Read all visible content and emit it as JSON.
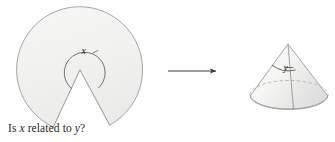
{
  "figure": {
    "caption": {
      "prefix": "Is ",
      "var_x": "x",
      "middle": " related to ",
      "var_y": "y",
      "suffix": "?"
    },
    "left_shape": {
      "name": "circular-sector-with-wedge-removed",
      "angle_label": "x",
      "description": "flat disk sector with a wedge cut out, reflex angle x marked at the center"
    },
    "arrow": {
      "name": "rightwards-arrow",
      "glyph": "→",
      "direction": "right"
    },
    "right_shape": {
      "name": "cone",
      "angle_label": "y",
      "description": "three dimensional cone formed by rolling the sector, apex angle y marked"
    },
    "colors": {
      "outline": "#9a9a9a",
      "fill": "#f2f2f0",
      "text": "#231f20",
      "arrow": "#3a3a3a",
      "hidden_edge": "#a8a8a8"
    }
  }
}
